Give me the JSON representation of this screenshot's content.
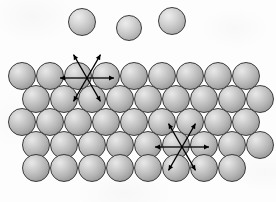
{
  "figure": {
    "width": 276,
    "height": 202,
    "background_color": "#fdfdfd",
    "sphere_outline_color": "#3a3a3a",
    "sphere_fill_light": "#e8e8e8",
    "sphere_fill_dark": "#7e7e7e",
    "arrow_color": "#000000"
  },
  "free_spheres": {
    "label": "free spheres above surface",
    "count": 3,
    "radius": 14,
    "items": [
      {
        "name": "free-sphere-1",
        "cx": 82,
        "cy": 22,
        "r": 14
      },
      {
        "name": "free-sphere-2",
        "cx": 129,
        "cy": 28,
        "r": 13
      },
      {
        "name": "free-sphere-3",
        "cx": 172,
        "cy": 21,
        "r": 14
      }
    ]
  },
  "lattice": {
    "label": "hexagonal close-packed lattice",
    "rows": 5,
    "radius": 14,
    "row_spacing": 23,
    "rows_data": [
      {
        "name": "lattice-row-1",
        "y": 76,
        "x_start": 22,
        "count": 9,
        "offset": 0
      },
      {
        "name": "lattice-row-2",
        "y": 99,
        "x_start": 36,
        "count": 9,
        "offset": 14
      },
      {
        "name": "lattice-row-3",
        "y": 122,
        "x_start": 22,
        "count": 9,
        "offset": 0
      },
      {
        "name": "lattice-row-4",
        "y": 145,
        "x_start": 36,
        "count": 9,
        "offset": 14
      },
      {
        "name": "lattice-row-5",
        "y": 168,
        "x_start": 36,
        "count": 8,
        "offset": 14
      }
    ],
    "x_spacing": 28
  },
  "arrow_clusters": {
    "label": "six-fold radial arrow stars",
    "count": 2,
    "arm_length": 27,
    "head_size": 5,
    "stroke_width": 1.3,
    "directions_deg": [
      0,
      60,
      120,
      180,
      240,
      300
    ],
    "items": [
      {
        "name": "arrow-cluster-upper-left",
        "cx": 87,
        "cy": 78
      },
      {
        "name": "arrow-cluster-lower-right",
        "cx": 182,
        "cy": 147
      }
    ]
  }
}
